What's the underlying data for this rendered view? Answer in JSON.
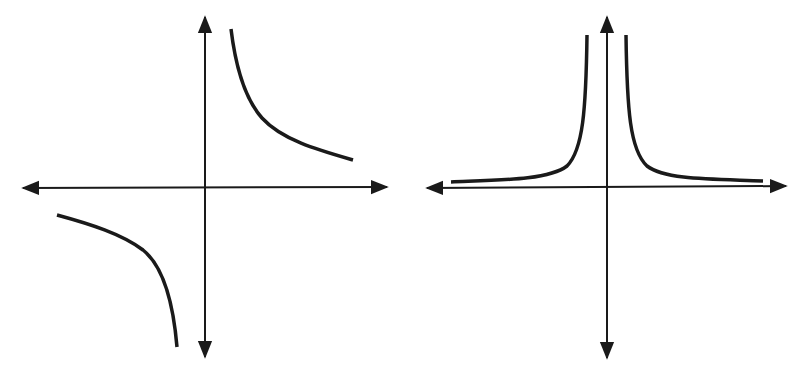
{
  "figure": {
    "background": "#ffffff",
    "stroke_color": "#1a1a1a",
    "graphs": [
      {
        "id": "left",
        "description": "Graph of y = 1/x (hyperbola in quadrants I and III)",
        "axes": {
          "origin": [
            204,
            187
          ],
          "x_range": [
            22,
            388
          ],
          "y_range": [
            16,
            358
          ]
        },
        "curves": [
          "M231,29 C236,70 246,100 262,118 C282,140 318,150 353,160",
          "M57,215 C90,224 122,234 143,250 C163,266 173,300 177,347"
        ]
      },
      {
        "id": "right",
        "description": "Graph of y = 1/x^2 (both branches in quadrants I and II)",
        "axes": {
          "origin": [
            607,
            187
          ],
          "x_range": [
            426,
            787
          ],
          "y_range": [
            16,
            359
          ]
        },
        "curves": [
          "M587,35 C585,110 582,150 566,167 C548,181 500,181 451,182",
          "M626,35 C628,110 630,150 647,167 C665,181 712,180 763,181"
        ]
      }
    ]
  }
}
